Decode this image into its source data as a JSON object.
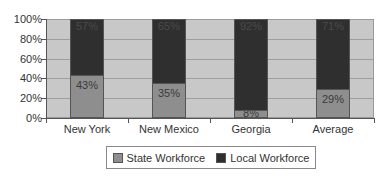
{
  "chart_data": {
    "type": "bar",
    "stacked": true,
    "percent_stacked": true,
    "title": "",
    "xlabel": "",
    "ylabel": "",
    "ylim": [
      0,
      100
    ],
    "yticks": [
      "0%",
      "20%",
      "40%",
      "60%",
      "80%",
      "100%"
    ],
    "grid": true,
    "legend_position": "bottom",
    "categories": [
      "New York",
      "New Mexico",
      "Georgia",
      "Average"
    ],
    "series": [
      {
        "name": "State Workforce",
        "color": "#8e8e8e",
        "values": [
          43,
          35,
          8,
          29
        ],
        "labels": [
          "43%",
          "35%",
          "8%",
          "29%"
        ]
      },
      {
        "name": "Local Workforce",
        "color": "#2f2f2f",
        "values": [
          57,
          65,
          92,
          71
        ],
        "labels": [
          "57%",
          "65%",
          "92%",
          "71%"
        ]
      }
    ]
  },
  "legend": {
    "state_label": "State Workforce",
    "local_label": "Local Workforce"
  }
}
